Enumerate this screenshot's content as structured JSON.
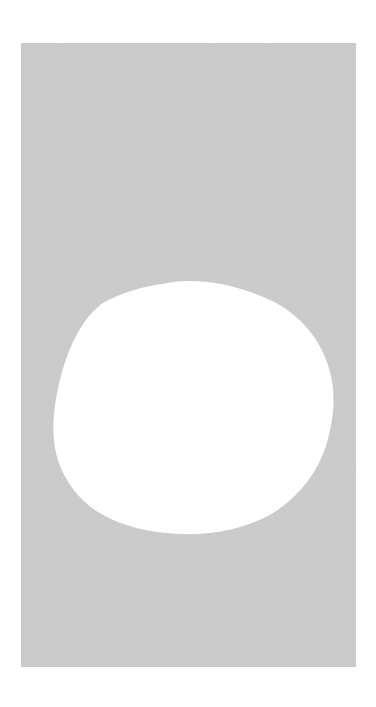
{
  "image": {
    "description": "Gray rectangular panel with an irregular white rounded blob (mask-like shape)",
    "background_color": "#ffffff",
    "panel": {
      "x": 21,
      "y": 43,
      "width": 335,
      "height": 624,
      "color": "#c9c9c9"
    },
    "blob": {
      "color": "#ffffff",
      "bounds": {
        "left": 54,
        "top": 281,
        "right": 333,
        "bottom": 534
      }
    }
  }
}
